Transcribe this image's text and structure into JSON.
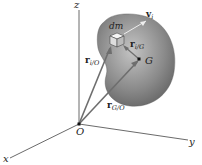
{
  "diagram": {
    "type": "rigid-body-position-vectors",
    "axes": {
      "x": "x",
      "y": "y",
      "z": "z",
      "origin": "O"
    },
    "body": {
      "element_label": "dm",
      "center_label": "G",
      "velocity": {
        "symbol": "v",
        "sub": "i"
      }
    },
    "vectors": {
      "r_iO": {
        "symbol": "r",
        "sub": "i/O"
      },
      "r_iG": {
        "symbol": "r",
        "sub": "i/G"
      },
      "r_GO": {
        "symbol": "r",
        "sub": "G/O"
      }
    },
    "colors": {
      "body": "#7a7a7a",
      "body_light": "#b5b5b5",
      "vector": "#6e6e6e",
      "axis": "#444444",
      "velocity": "#e8e8e8"
    }
  }
}
